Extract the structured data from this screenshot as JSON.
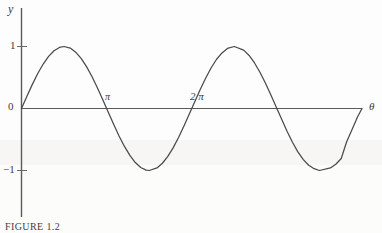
{
  "figure": {
    "caption": "FIGURE 1.2",
    "background_color": "#fefefe",
    "ink_color": "#4a4a4a"
  },
  "chart_data": {
    "type": "line",
    "title": "",
    "subtitle": "",
    "xlabel": "θ",
    "ylabel": "y",
    "function": "y = sin θ",
    "grid": false,
    "legend": false,
    "legend_position": "none",
    "xlim": [
      0,
      12.566370614359172
    ],
    "ylim": [
      -1.35,
      1.35
    ],
    "x_tick_labels": [
      "0",
      "π",
      "2 π"
    ],
    "x_tick_values": [
      0,
      3.141592653589793,
      6.283185307179586
    ],
    "y_tick_labels": [
      "1",
      "0",
      "−1"
    ],
    "y_tick_values": [
      1,
      0,
      -1
    ],
    "axis_origin_label": "0",
    "amplitude": 1,
    "period": 6.283185307179586,
    "cycles_shown": 2,
    "zero_crossings_x": [
      0,
      3.141592653589793,
      6.283185307179586,
      9.42477796076938,
      12.566370614359172
    ],
    "maxima": [
      {
        "x": 1.5707963267948966,
        "y": 1
      },
      {
        "x": 7.853981633974483,
        "y": 1
      }
    ],
    "minima": [
      {
        "x": 4.71238898038469,
        "y": -1
      },
      {
        "x": 10.995574287564276,
        "y": -1
      }
    ],
    "series": [
      {
        "name": "sin θ",
        "color": "#4a4a4a",
        "x": [
          0,
          0.2,
          0.4,
          0.6,
          0.8,
          1,
          1.2,
          1.4,
          1.5708,
          1.8,
          2,
          2.2,
          2.4,
          2.6,
          2.8,
          3,
          3.1416,
          3.4,
          3.6,
          3.8,
          4,
          4.2,
          4.4,
          4.6,
          4.7124,
          5,
          5.2,
          5.4,
          5.6,
          5.8,
          6,
          6.2832,
          6.6,
          6.8,
          7,
          7.2,
          7.4,
          7.6,
          7.854,
          8.2,
          8.4,
          8.6,
          8.8,
          9,
          9.2,
          9.4248,
          9.8,
          10,
          10.2,
          10.4,
          10.6,
          10.8,
          10.9956,
          11.4,
          11.6,
          11.8,
          12,
          12.2,
          12.4,
          12.5664
        ],
        "y": [
          0,
          0.199,
          0.389,
          0.565,
          0.717,
          0.841,
          0.932,
          0.985,
          1,
          0.974,
          0.909,
          0.808,
          0.675,
          0.516,
          0.335,
          0.141,
          0,
          -0.256,
          -0.443,
          -0.612,
          -0.757,
          -0.872,
          -0.952,
          -0.994,
          -1,
          -0.959,
          -0.883,
          -0.773,
          -0.631,
          -0.465,
          -0.279,
          0,
          0.311,
          0.492,
          0.657,
          0.794,
          0.896,
          0.969,
          1,
          0.942,
          0.855,
          0.734,
          0.585,
          0.412,
          0.223,
          0,
          -0.366,
          -0.544,
          -0.699,
          -0.825,
          -0.915,
          -0.971,
          -1,
          -0.959,
          -0.899,
          -0.806,
          -0.537,
          -0.337,
          -0.137,
          0
        ]
      }
    ]
  },
  "axes": {
    "y_axis_label": "y",
    "x_axis_label": "θ",
    "origin_label": "0",
    "tick_top": "1",
    "tick_bottom": "−1",
    "tick_pi": "π",
    "tick_two_pi": "2 π"
  }
}
